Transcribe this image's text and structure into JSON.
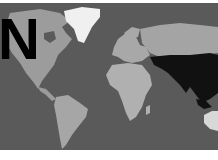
{
  "map": {
    "type": "world-map",
    "style": "grayscale",
    "highlighted_region": "Asia",
    "colors": {
      "ocean": "#5a5a5a",
      "land": "#a8a8a8",
      "greenland": "#f2f2f2",
      "highlight": "#111111",
      "background": "#ffffff"
    }
  },
  "overlay": {
    "letter": "N"
  }
}
